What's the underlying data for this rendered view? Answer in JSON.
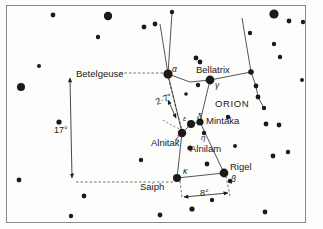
{
  "figure": {
    "type": "star-chart",
    "subject": "ORION",
    "background_color": "#fdfdfc",
    "ink_color": "#1a1a1a",
    "frame": {
      "x": 6,
      "y": 5,
      "width": 300,
      "height": 218,
      "stroke": "#8a8a8a"
    }
  },
  "labels": {
    "constellation": "ORION",
    "betelgeuse": "Betelgeuse",
    "bellatrix": "Bellatrix",
    "mintaka": "Mintaka",
    "alnilam": "Alnilam",
    "alnitak": "Alnitak",
    "rigel": "Rigel",
    "saiph": "Saiph",
    "alpha": "α",
    "beta": "β",
    "gamma": "γ",
    "delta": "δ",
    "epsilon": "ε",
    "zeta": "ζ",
    "eta": "η",
    "kappa": "κ"
  },
  "measurements": [
    {
      "name": "betelgeuse-to-saiph",
      "value": "17°",
      "x": 54,
      "y": 133
    },
    {
      "name": "betelgeuse-to-belt",
      "value": "2·7°",
      "x": 160,
      "y": 103
    },
    {
      "name": "saiph-to-rigel",
      "value": "8°",
      "x": 205,
      "y": 196
    }
  ],
  "named_stars": [
    {
      "name": "betelgeuse",
      "greek": "α",
      "x": 168,
      "y": 74,
      "r": 4.6
    },
    {
      "name": "bellatrix",
      "greek": "γ",
      "x": 210,
      "y": 80,
      "r": 4.4
    },
    {
      "name": "mintaka",
      "greek": "δ",
      "x": 200,
      "y": 122,
      "r": 3.6
    },
    {
      "name": "alnilam",
      "greek": "ε",
      "x": 191,
      "y": 124,
      "r": 4.0
    },
    {
      "name": "alnitak",
      "greek": "ζ",
      "x": 182,
      "y": 133,
      "r": 4.2
    },
    {
      "name": "rigel",
      "greek": "β",
      "x": 224,
      "y": 173,
      "r": 4.4
    },
    {
      "name": "saiph",
      "greek": "κ",
      "x": 177,
      "y": 178,
      "r": 4.0
    },
    {
      "name": "eta",
      "greek": "η",
      "x": 204,
      "y": 133,
      "r": 2.2
    }
  ],
  "field_stars": [
    {
      "x": 53,
      "y": 15,
      "r": 2.4
    },
    {
      "x": 108,
      "y": 16,
      "r": 4.2
    },
    {
      "x": 98,
      "y": 37,
      "r": 2.2
    },
    {
      "x": 39,
      "y": 66,
      "r": 2.0
    },
    {
      "x": 21,
      "y": 87,
      "r": 4.0
    },
    {
      "x": 59,
      "y": 122,
      "r": 2.6
    },
    {
      "x": 19,
      "y": 180,
      "r": 2.4
    },
    {
      "x": 84,
      "y": 196,
      "r": 2.4
    },
    {
      "x": 71,
      "y": 216,
      "r": 2.2
    },
    {
      "x": 141,
      "y": 160,
      "r": 2.2
    },
    {
      "x": 144,
      "y": 27,
      "r": 2.4
    },
    {
      "x": 155,
      "y": 24,
      "r": 2.4
    },
    {
      "x": 172,
      "y": 12,
      "r": 2.2
    },
    {
      "x": 196,
      "y": 58,
      "r": 2.4
    },
    {
      "x": 200,
      "y": 62,
      "r": 2.4
    },
    {
      "x": 198,
      "y": 85,
      "r": 2.2
    },
    {
      "x": 228,
      "y": 117,
      "r": 2.2
    },
    {
      "x": 235,
      "y": 146,
      "r": 2.0
    },
    {
      "x": 266,
      "y": 124,
      "r": 2.4
    },
    {
      "x": 279,
      "y": 125,
      "r": 2.4
    },
    {
      "x": 190,
      "y": 148,
      "r": 2.6
    },
    {
      "x": 207,
      "y": 164,
      "r": 2.4
    },
    {
      "x": 230,
      "y": 181,
      "r": 2.2
    },
    {
      "x": 273,
      "y": 156,
      "r": 2.4
    },
    {
      "x": 288,
      "y": 152,
      "r": 2.2
    },
    {
      "x": 192,
      "y": 209,
      "r": 2.6
    },
    {
      "x": 212,
      "y": 200,
      "r": 2.2
    },
    {
      "x": 265,
      "y": 212,
      "r": 2.4
    },
    {
      "x": 160,
      "y": 215,
      "r": 2.4
    },
    {
      "x": 274,
      "y": 14,
      "r": 4.6
    },
    {
      "x": 289,
      "y": 21,
      "r": 2.4
    },
    {
      "x": 303,
      "y": 22,
      "r": 2.2
    },
    {
      "x": 250,
      "y": 33,
      "r": 2.2
    },
    {
      "x": 274,
      "y": 44,
      "r": 2.2
    },
    {
      "x": 280,
      "y": 57,
      "r": 2.2
    },
    {
      "x": 251,
      "y": 72,
      "r": 2.8
    },
    {
      "x": 256,
      "y": 86,
      "r": 2.4
    },
    {
      "x": 258,
      "y": 97,
      "r": 2.4
    },
    {
      "x": 264,
      "y": 108,
      "r": 2.2
    },
    {
      "x": 302,
      "y": 80,
      "r": 2.0
    },
    {
      "x": 186,
      "y": 94,
      "r": 1.8
    }
  ],
  "constellation_lines": [
    {
      "name": "betelgeuse-bellatrix",
      "points": "168,74 190,82 210,80"
    },
    {
      "name": "betelgeuse-to-upper",
      "points": "168,74 160,24"
    },
    {
      "name": "betelgeuse-to-upper-2",
      "points": "168,74 172,12"
    },
    {
      "name": "bellatrix-to-shield",
      "points": "210,80 251,72"
    },
    {
      "name": "shield-chain",
      "points": "251,72 256,86 258,97 264,108"
    },
    {
      "name": "shield-to-top",
      "points": "251,72 242,18"
    },
    {
      "name": "bellatrix-to-belt",
      "points": "210,80 200,122"
    },
    {
      "name": "betelgeuse-to-belt-line",
      "points": "168,74 182,133"
    },
    {
      "name": "belt-row",
      "points": "182,133 191,124 200,122"
    },
    {
      "name": "alnitak-to-saiph",
      "points": "182,133 177,178"
    },
    {
      "name": "saiph-to-rigel-line",
      "points": "177,178 224,173"
    },
    {
      "name": "rigel-to-belt",
      "points": "224,173 200,122"
    }
  ],
  "annotation_lines": [
    {
      "name": "seventeen-degree-arrow",
      "points": "68,76 70,176"
    },
    {
      "name": "betelgeuse-tick",
      "points": "130,73 166,73"
    },
    {
      "name": "saiph-tick",
      "points": "70,180 175,180"
    }
  ]
}
